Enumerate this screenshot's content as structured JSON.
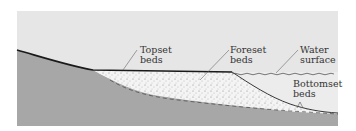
{
  "diagram": {
    "labels": {
      "topset": [
        "Topset",
        "beds"
      ],
      "foreset": [
        "Foreset",
        "beds"
      ],
      "water": [
        "Water",
        "surface"
      ],
      "bottomset": [
        "Bottomset",
        "beds"
      ]
    },
    "colors": {
      "sky": "#e6e6e6",
      "water": "#ebebeb",
      "bedrock": "#a7a7a7",
      "sediment": "#f4f4f4",
      "line": "#1a1a1a",
      "leader": "#666666"
    }
  }
}
